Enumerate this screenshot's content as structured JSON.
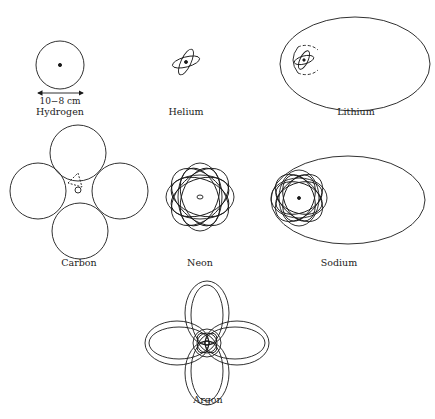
{
  "diagram": {
    "colors": {
      "line": "#1a1a1a",
      "background": "#ffffff"
    },
    "atoms": [
      {
        "name": "Hydrogen",
        "label": "Hydrogen",
        "scale_label": "10−8 cm"
      },
      {
        "name": "Helium",
        "label": "Helium"
      },
      {
        "name": "Lithium",
        "label": "Lithium"
      },
      {
        "name": "Carbon",
        "label": "Carbon"
      },
      {
        "name": "Neon",
        "label": "Neon"
      },
      {
        "name": "Sodium",
        "label": "Sodium"
      },
      {
        "name": "Argon",
        "label": "Argon"
      }
    ]
  }
}
